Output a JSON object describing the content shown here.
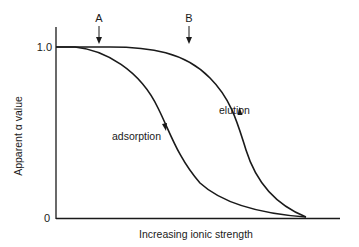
{
  "diagram": {
    "type": "line-diagram",
    "y_axis": {
      "label": "Apparent α value",
      "ticks": [
        {
          "value": "1.0"
        },
        {
          "value": "0"
        }
      ]
    },
    "x_axis": {
      "label": "Increasing ionic strength"
    },
    "markers": [
      {
        "label": "A",
        "description": "arrow pointing down to plateau near start of adsorption curve drop"
      },
      {
        "label": "B",
        "description": "arrow pointing down near start of elution curve drop"
      }
    ],
    "curves": [
      {
        "name": "adsorption",
        "label": "adsorption",
        "direction": "downward arrow (increasing ionic strength)"
      },
      {
        "name": "elution",
        "label": "elution",
        "direction": "upward arrow (decreasing ionic strength)"
      }
    ],
    "colors": {
      "line": "#1a1a1a",
      "background": "#ffffff"
    }
  }
}
